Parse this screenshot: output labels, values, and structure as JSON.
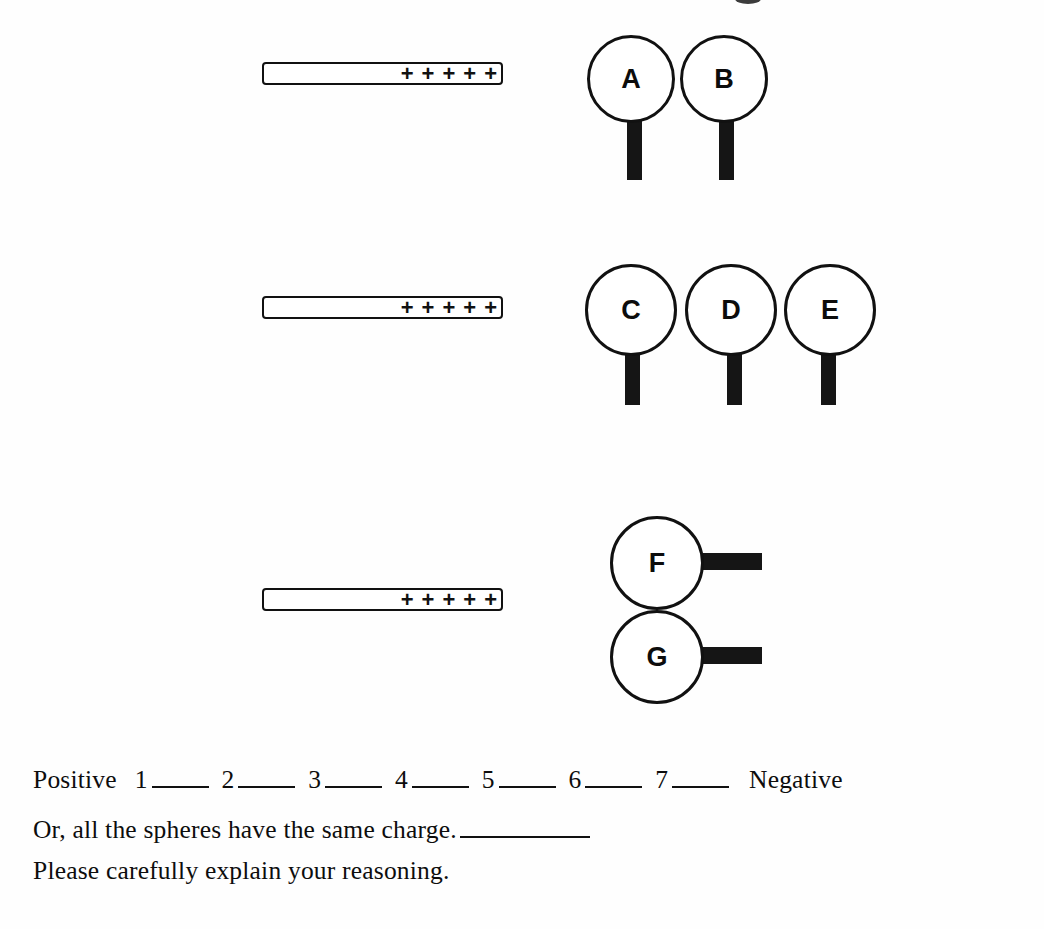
{
  "worksheet": {
    "rods": [
      {
        "id": "rod-1",
        "charge_symbol": "+",
        "charge_count": 5,
        "charge_sign": "positive"
      },
      {
        "id": "rod-2",
        "charge_symbol": "+",
        "charge_count": 5,
        "charge_sign": "positive"
      },
      {
        "id": "rod-3",
        "charge_symbol": "+",
        "charge_count": 5,
        "charge_sign": "positive"
      }
    ],
    "groups": [
      {
        "id": "group-ab",
        "arrangement": "horizontal-pair",
        "spheres": [
          {
            "label": "A"
          },
          {
            "label": "B"
          }
        ]
      },
      {
        "id": "group-cde",
        "arrangement": "horizontal-triple",
        "spheres": [
          {
            "label": "C"
          },
          {
            "label": "D"
          },
          {
            "label": "E"
          }
        ]
      },
      {
        "id": "group-fg",
        "arrangement": "vertical-pair",
        "spheres": [
          {
            "label": "F"
          },
          {
            "label": "G"
          }
        ]
      }
    ],
    "rating_scale": {
      "left_label": "Positive",
      "right_label": "Negative",
      "options": [
        "1",
        "2",
        "3",
        "4",
        "5",
        "6",
        "7"
      ]
    },
    "same_charge_line": {
      "text": "Or, all the spheres have the same charge."
    },
    "instruction_line": {
      "text": "Please carefully explain your reasoning."
    }
  },
  "colors": {
    "ink": "#111111",
    "paper": "#fefefe",
    "stem": "#151515"
  }
}
